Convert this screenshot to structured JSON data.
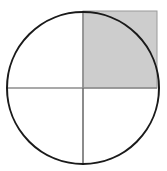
{
  "figure": {
    "title": "Circle with shaded upper-right quadrant square",
    "type": "geometric-diagram",
    "canvas": {
      "width": 167,
      "height": 171,
      "background_color": "#ffffff",
      "border": "none"
    },
    "colors": {
      "circle_stroke": "#1a1a1a",
      "shaded_fill": "#cdcdcd",
      "shaded_stroke": "#9a9a9a",
      "axis_line": "#8c8c8c",
      "axis_line_lower": "#6e6e6e",
      "background": "#ffffff"
    },
    "circle": {
      "label": "circle-outline",
      "center_x": 83,
      "center_y": 88,
      "radius": 76,
      "stroke_width": 2,
      "fill": "none"
    },
    "shaded_square": {
      "label": "shaded-quadrant-square",
      "description": "Square bounding box of the upper-right quadrant; corner extends beyond the circular arc",
      "x": 83,
      "y": 11,
      "width": 74,
      "height": 77,
      "fill": "#cdcdcd",
      "stroke_width": 1
    },
    "vertical_radius": {
      "label": "vertical-diameter-line",
      "x": 83,
      "y_top": 11,
      "y_bottom": 163,
      "stroke_width": 1.6
    },
    "horizontal_radius": {
      "label": "horizontal-diameter-line",
      "y": 88,
      "x_left": 7,
      "x_right": 157,
      "stroke_width": 1.6
    },
    "center_point": {
      "label": "circle-center",
      "x": 83,
      "y": 88
    }
  }
}
